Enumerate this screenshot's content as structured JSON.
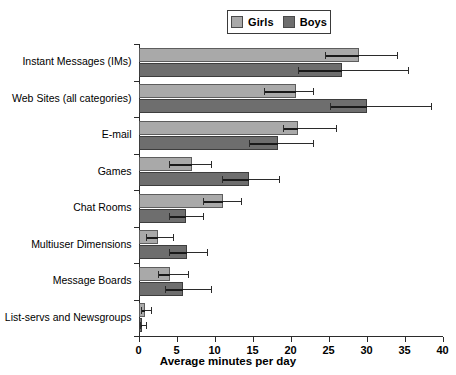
{
  "chart_data": {
    "type": "bar",
    "orientation": "horizontal",
    "title": "",
    "xlabel": "Average minutes per day",
    "ylabel": "",
    "xlim": [
      0,
      40
    ],
    "xticks": [
      0,
      5,
      10,
      15,
      20,
      25,
      30,
      35,
      40
    ],
    "grid": false,
    "legend_position": "top-center",
    "categories": [
      "Instant Messages (IMs)",
      "Web Sites (all categories)",
      "E-mail",
      "Games",
      "Chat Rooms",
      "Multiuser Dimensions",
      "Message Boards",
      "List-servs and Newsgroups"
    ],
    "series": [
      {
        "name": "Girls",
        "color": "#a9a9a9",
        "values": [
          29.0,
          20.7,
          21.0,
          7.1,
          11.1,
          2.6,
          4.2,
          0.9
        ],
        "err_low": [
          24.5,
          16.5,
          19.0,
          4.0,
          8.5,
          1.0,
          2.5,
          0.3
        ],
        "err_high": [
          34.0,
          23.0,
          26.0,
          9.5,
          13.5,
          4.5,
          6.5,
          1.6
        ]
      },
      {
        "name": "Boys",
        "color": "#6e6e6e",
        "values": [
          26.8,
          30.1,
          18.3,
          14.6,
          6.2,
          6.4,
          5.8,
          0.5
        ],
        "err_low": [
          21.0,
          25.2,
          14.5,
          11.0,
          4.0,
          4.0,
          3.5,
          0.2
        ],
        "err_high": [
          35.5,
          38.5,
          23.0,
          18.5,
          8.5,
          9.0,
          9.5,
          1.0
        ]
      }
    ]
  },
  "legend": {
    "items": [
      {
        "label": "Girls",
        "color": "#a9a9a9"
      },
      {
        "label": "Boys",
        "color": "#6e6e6e"
      }
    ]
  },
  "axis": {
    "x_title": "Average minutes per day",
    "x_tick_labels": [
      "0",
      "5",
      "10",
      "15",
      "20",
      "25",
      "30",
      "35",
      "40"
    ]
  }
}
